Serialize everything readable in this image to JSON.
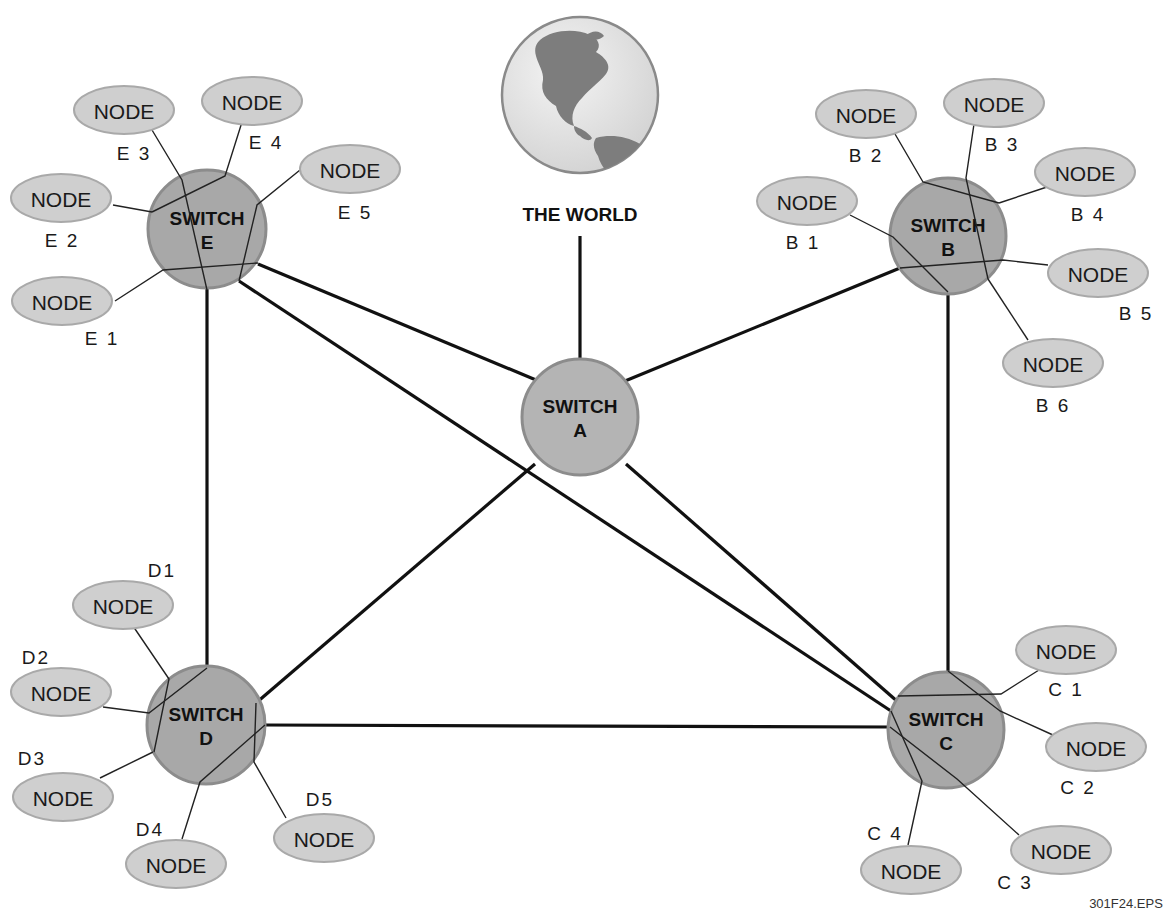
{
  "diagram": {
    "world": {
      "label": "THE WORLD",
      "cx": 580,
      "cy": 95,
      "r": 78,
      "label_x": 580,
      "label_y": 214
    },
    "figure_id": {
      "text": "301F24.EPS",
      "x": 1126,
      "y": 903
    },
    "colors": {
      "switch_fill": "#a8a8a8",
      "switch_a_fill": "#b4b4b4",
      "node_fill": "#cfcfcf",
      "line": "#111111",
      "globe_ocean": "#e6e6e6",
      "globe_land": "#7a7a7a"
    },
    "switches": [
      {
        "id": "A",
        "line1": "SWITCH",
        "line2": "A",
        "cx": 580,
        "cy": 417,
        "r": 58
      },
      {
        "id": "B",
        "line1": "SWITCH",
        "line2": "B",
        "cx": 948,
        "cy": 236,
        "r": 58
      },
      {
        "id": "C",
        "line1": "SWITCH",
        "line2": "C",
        "cx": 946,
        "cy": 730,
        "r": 58
      },
      {
        "id": "D",
        "line1": "SWITCH",
        "line2": "D",
        "cx": 206,
        "cy": 725,
        "r": 59
      },
      {
        "id": "E",
        "line1": "SWITCH",
        "line2": "E",
        "cx": 207,
        "cy": 229,
        "r": 59
      }
    ],
    "trunks": [
      {
        "from": "WORLD",
        "x1": 580,
        "y1": 236,
        "x2": 580,
        "y2": 359
      },
      {
        "from": "A",
        "to": "E",
        "x1": 536,
        "y1": 380,
        "x2": 258,
        "y2": 264
      },
      {
        "from": "A",
        "to": "B",
        "x1": 625,
        "y1": 381,
        "x2": 900,
        "y2": 268
      },
      {
        "from": "A",
        "to": "D",
        "x1": 535,
        "y1": 464,
        "x2": 256,
        "y2": 703
      },
      {
        "from": "A",
        "to": "C",
        "x1": 626,
        "y1": 464,
        "x2": 898,
        "y2": 702
      },
      {
        "from": "E",
        "to": "D",
        "x1": 207,
        "y1": 288,
        "x2": 207,
        "y2": 666
      },
      {
        "from": "E",
        "to": "C",
        "x1": 239,
        "y1": 281,
        "x2": 891,
        "y2": 711
      },
      {
        "from": "B",
        "to": "C",
        "x1": 948,
        "y1": 294,
        "x2": 948,
        "y2": 671
      },
      {
        "from": "D",
        "to": "C",
        "x1": 265,
        "y1": 725,
        "x2": 889,
        "y2": 727
      }
    ],
    "nodes": [
      {
        "id": "E1",
        "text": "NODE",
        "label": "E 1",
        "cx": 62,
        "cy": 301,
        "lx": 102,
        "ly": 338
      },
      {
        "id": "E2",
        "text": "NODE",
        "label": "E 2",
        "cx": 61,
        "cy": 198,
        "lx": 62,
        "ly": 240
      },
      {
        "id": "E3",
        "text": "NODE",
        "label": "E 3",
        "cx": 124,
        "cy": 110,
        "lx": 134,
        "ly": 153
      },
      {
        "id": "E4",
        "text": "NODE",
        "label": "E 4",
        "cx": 252,
        "cy": 101,
        "lx": 266,
        "ly": 142
      },
      {
        "id": "E5",
        "text": "NODE",
        "label": "E 5",
        "cx": 350,
        "cy": 169,
        "lx": 355,
        "ly": 212
      },
      {
        "id": "B1",
        "text": "NODE",
        "label": "B 1",
        "cx": 807,
        "cy": 201,
        "lx": 803,
        "ly": 242
      },
      {
        "id": "B2",
        "text": "NODE",
        "label": "B 2",
        "cx": 866,
        "cy": 114,
        "lx": 866,
        "ly": 155
      },
      {
        "id": "B3",
        "text": "NODE",
        "label": "B 3",
        "cx": 994,
        "cy": 103,
        "lx": 1002,
        "ly": 144
      },
      {
        "id": "B4",
        "text": "NODE",
        "label": "B 4",
        "cx": 1085,
        "cy": 172,
        "lx": 1088,
        "ly": 214
      },
      {
        "id": "B5",
        "text": "NODE",
        "label": "B 5",
        "cx": 1098,
        "cy": 273,
        "lx": 1136,
        "ly": 313
      },
      {
        "id": "B6",
        "text": "NODE",
        "label": "B 6",
        "cx": 1053,
        "cy": 363,
        "lx": 1053,
        "ly": 405
      },
      {
        "id": "C1",
        "text": "NODE",
        "label": "C 1",
        "cx": 1066,
        "cy": 650,
        "lx": 1066,
        "ly": 689
      },
      {
        "id": "C2",
        "text": "NODE",
        "label": "C 2",
        "cx": 1096,
        "cy": 747,
        "lx": 1078,
        "ly": 787
      },
      {
        "id": "C3",
        "text": "NODE",
        "label": "C 3",
        "cx": 1061,
        "cy": 850,
        "lx": 1015,
        "ly": 882
      },
      {
        "id": "C4",
        "text": "NODE",
        "label": "C 4",
        "cx": 911,
        "cy": 870,
        "lx": 885,
        "ly": 833
      },
      {
        "id": "D1",
        "text": "NODE",
        "label": "D1",
        "cx": 123,
        "cy": 605,
        "lx": 162,
        "ly": 570
      },
      {
        "id": "D2",
        "text": "NODE",
        "label": "D2",
        "cx": 61,
        "cy": 692,
        "lx": 36,
        "ly": 657
      },
      {
        "id": "D3",
        "text": "NODE",
        "label": "D3",
        "cx": 63,
        "cy": 797,
        "lx": 32,
        "ly": 758
      },
      {
        "id": "D4",
        "text": "NODE",
        "label": "D4",
        "cx": 176,
        "cy": 864,
        "lx": 150,
        "ly": 829
      },
      {
        "id": "D5",
        "text": "NODE",
        "label": "D5",
        "cx": 324,
        "cy": 838,
        "lx": 320,
        "ly": 799
      }
    ],
    "spokes": [
      {
        "node": "E1",
        "x1": 115,
        "y1": 301,
        "x2": 163,
        "y2": 270,
        "x3": 258,
        "y3": 263
      },
      {
        "node": "E2",
        "x1": 113,
        "y1": 205,
        "x2": 152,
        "y2": 212
      },
      {
        "node": "E3",
        "x1": 152,
        "y1": 130,
        "x2": 182,
        "y2": 180,
        "x3": 207,
        "y3": 290
      },
      {
        "node": "E4",
        "x1": 242,
        "y1": 122,
        "x2": 225,
        "y2": 176,
        "x3": 152,
        "y3": 212
      },
      {
        "node": "E5",
        "x1": 300,
        "y1": 170,
        "x2": 257,
        "y2": 205,
        "x3": 239,
        "y3": 281
      },
      {
        "node": "B1",
        "x1": 850,
        "y1": 215,
        "x2": 893,
        "y2": 237,
        "x3": 948,
        "y3": 292
      },
      {
        "node": "B2",
        "x1": 895,
        "y1": 134,
        "x2": 923,
        "y2": 182,
        "x3": 999,
        "y3": 203
      },
      {
        "node": "B3",
        "x1": 974,
        "y1": 124,
        "x2": 966,
        "y2": 178,
        "x3": 988,
        "y3": 279
      },
      {
        "node": "B4",
        "x1": 1050,
        "y1": 186,
        "x2": 999,
        "y2": 203
      },
      {
        "node": "B5",
        "x1": 1048,
        "y1": 265,
        "x2": 1003,
        "y2": 260,
        "x3": 900,
        "y3": 268
      },
      {
        "node": "B6",
        "x1": 1028,
        "y1": 340,
        "x2": 988,
        "y2": 279
      },
      {
        "node": "C1",
        "x1": 1039,
        "y1": 670,
        "x2": 1001,
        "y2": 694,
        "x3": 898,
        "y3": 696
      },
      {
        "node": "C2",
        "x1": 1053,
        "y1": 735,
        "x2": 1000,
        "y2": 711,
        "x3": 948,
        "y3": 671
      },
      {
        "node": "C3",
        "x1": 1019,
        "y1": 835,
        "x2": 957,
        "y2": 779,
        "x3": 890,
        "y3": 727
      },
      {
        "node": "C4",
        "x1": 908,
        "y1": 845,
        "x2": 922,
        "y2": 781,
        "x3": 891,
        "y3": 711
      },
      {
        "node": "D1",
        "x1": 133,
        "y1": 626,
        "x2": 169,
        "y2": 679,
        "x3": 154,
        "y3": 752
      },
      {
        "node": "D2",
        "x1": 103,
        "y1": 707,
        "x2": 149,
        "y2": 713,
        "x3": 207,
        "y3": 668
      },
      {
        "node": "D3",
        "x1": 100,
        "y1": 778,
        "x2": 153,
        "y2": 752
      },
      {
        "node": "D4",
        "x1": 182,
        "y1": 839,
        "x2": 200,
        "y2": 782,
        "x3": 265,
        "y3": 725
      },
      {
        "node": "D5",
        "x1": 286,
        "y1": 818,
        "x2": 254,
        "y2": 762,
        "x3": 256,
        "y3": 703
      }
    ]
  }
}
